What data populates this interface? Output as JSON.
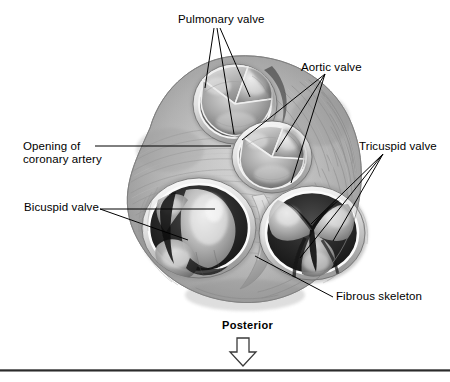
{
  "figure": {
    "background_color": "#ffffff",
    "line_color": "#000000",
    "rule_color": "#2b2b2b"
  },
  "labels": {
    "pulmonary_valve": "Pulmonary valve",
    "aortic_valve": "Aortic valve",
    "coronary_opening_line1": "Opening of",
    "coronary_opening_line2": "coronary artery",
    "tricuspid_valve": "Tricuspid valve",
    "bicuspid_valve": "Bicuspid valve",
    "fibrous_skeleton": "Fibrous skeleton",
    "orientation": "Posterior"
  },
  "structures": [
    {
      "name": "pulmonary-valve",
      "cusps": 3,
      "position": "upper-left"
    },
    {
      "name": "aortic-valve",
      "cusps": 3,
      "position": "upper-center-right"
    },
    {
      "name": "bicuspid-valve",
      "cusps": 2,
      "position": "lower-left"
    },
    {
      "name": "tricuspid-valve",
      "cusps": 3,
      "position": "lower-right"
    },
    {
      "name": "fibrous-skeleton",
      "cusps": 0,
      "position": "between-av-valves"
    }
  ],
  "orientation_marker": {
    "label": "Posterior",
    "arrow_direction": "down"
  }
}
